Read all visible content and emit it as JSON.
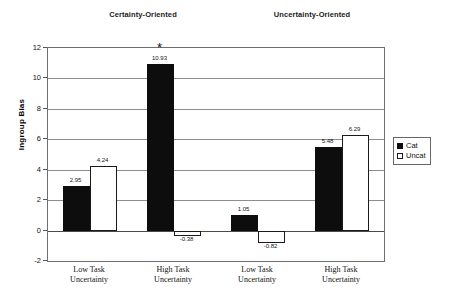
{
  "chart_data": {
    "type": "bar",
    "title": "",
    "xlabel": "",
    "ylabel": "Ingroup Bias",
    "ylim": [
      -2,
      12
    ],
    "ytick_step": 2,
    "yticks": [
      12,
      10,
      8,
      6,
      4,
      2,
      0,
      -2
    ],
    "grid": true,
    "legend_position": "right",
    "categories": [
      "Low Task Uncertainty",
      "High Task Uncertainty",
      "Low Task Uncertainty",
      "High Task Uncertainty"
    ],
    "category_lines": [
      [
        "Low Task",
        "Uncertainty"
      ],
      [
        "High Task",
        "Uncertainty"
      ],
      [
        "Low Task",
        "Uncertainty"
      ],
      [
        "High Task",
        "Uncertainty"
      ]
    ],
    "series": [
      {
        "name": "Cat",
        "color": "#0d0d0d",
        "values": [
          2.95,
          10.93,
          1.05,
          5.48
        ]
      },
      {
        "name": "Uncat",
        "color": "#ffffff",
        "values": [
          4.24,
          -0.38,
          -0.82,
          6.29
        ]
      }
    ],
    "value_labels": [
      [
        "2.95",
        "4.24"
      ],
      [
        "10.93",
        "-0.38"
      ],
      [
        "1.05",
        "-0.82"
      ],
      [
        "5.48",
        "6.29"
      ]
    ],
    "annotations": [
      {
        "text": "*",
        "group_index": 1,
        "series_index": 0,
        "meaning": "significance-asterisk"
      }
    ],
    "group_headers": [
      {
        "label": "Certainty-Oriented",
        "spans_categories": [
          0,
          1
        ]
      },
      {
        "label": "Uncertainty-Oriented",
        "spans_categories": [
          2,
          3
        ]
      }
    ]
  },
  "legend": {
    "items": [
      {
        "label": "Cat",
        "swatch": "filled-black-square"
      },
      {
        "label": "Uncat",
        "swatch": "outlined-white-square"
      }
    ]
  }
}
